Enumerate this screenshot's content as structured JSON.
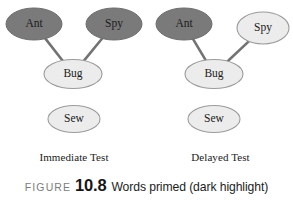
{
  "figure": {
    "label_word": "FIGURE",
    "number": "10.8",
    "caption_text": "Words primed (dark highlight)"
  },
  "panels": [
    {
      "id": "immediate",
      "title": "Immediate Test",
      "nodes": [
        {
          "id": "ant",
          "label": "Ant",
          "style": "dark",
          "cx": 34,
          "cy": 24,
          "rx": 28,
          "ry": 16
        },
        {
          "id": "spy",
          "label": "Spy",
          "style": "dark",
          "cx": 114,
          "cy": 24,
          "rx": 28,
          "ry": 16
        },
        {
          "id": "bug",
          "label": "Bug",
          "style": "light",
          "cx": 73,
          "cy": 74,
          "rx": 29,
          "ry": 14.5
        },
        {
          "id": "sew",
          "label": "Sew",
          "style": "light",
          "cx": 74,
          "cy": 119,
          "rx": 26,
          "ry": 13.5
        }
      ],
      "edges": [
        {
          "from": "ant",
          "to": "bug"
        },
        {
          "from": "spy",
          "to": "bug"
        }
      ]
    },
    {
      "id": "delayed",
      "title": "Delayed Test",
      "nodes": [
        {
          "id": "ant",
          "label": "Ant",
          "style": "dark",
          "cx": 184,
          "cy": 24,
          "rx": 28,
          "ry": 16
        },
        {
          "id": "spy",
          "label": "Spy",
          "style": "light",
          "cx": 263,
          "cy": 28,
          "rx": 26,
          "ry": 16
        },
        {
          "id": "bug",
          "label": "Bug",
          "style": "light",
          "cx": 214,
          "cy": 74,
          "rx": 29,
          "ry": 14.5
        },
        {
          "id": "sew",
          "label": "Sew",
          "style": "light",
          "cx": 214,
          "cy": 119,
          "rx": 26,
          "ry": 13.5
        }
      ],
      "edges": [
        {
          "from": "ant",
          "to": "bug"
        },
        {
          "from": "spy",
          "to": "bug"
        }
      ]
    }
  ],
  "colors": {
    "node_dark_fill": "#7a7a7a",
    "node_dark_stroke": "#6d6d6d",
    "node_light_fill": "#ececec",
    "node_light_stroke": "#9b9b9b",
    "edge": "#737373",
    "page_background": "#ffffff",
    "caption_label": "#7d7d7d",
    "caption_number": "#161616",
    "caption_text": "#1d1d1d"
  }
}
